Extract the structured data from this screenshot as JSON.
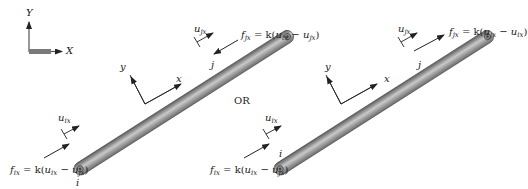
{
  "global_axes": {
    "y_label": "Y",
    "x_label": "X"
  },
  "separator": "OR",
  "diagrams": [
    {
      "node_i": "i",
      "node_j": "j",
      "local_y": "y",
      "local_x": "x",
      "disp_i": {
        "base": "u",
        "sub": "ix"
      },
      "disp_j": {
        "base": "u",
        "sub": "jx"
      },
      "force_i": "f_ix = k(u_ix − u_jx)",
      "force_j": "f_jx = k(u_ix − u_jx)",
      "force_i_parts": {
        "f": "f",
        "f_sub": "ix",
        "eq": " = k(",
        "u1": "u",
        "u1_sub": "ix",
        "minus": " − ",
        "u2": "u",
        "u2_sub": "jx",
        "close": ")"
      },
      "force_j_parts": {
        "f": "f",
        "f_sub": "jx",
        "eq": " = k(",
        "u1": "u",
        "u1_sub": "ix",
        "minus": " − ",
        "u2": "u",
        "u2_sub": "jx",
        "close": ")"
      }
    },
    {
      "node_i": "i",
      "node_j": "j",
      "local_y": "y",
      "local_x": "x",
      "disp_i": {
        "base": "u",
        "sub": "ix"
      },
      "disp_j": {
        "base": "u",
        "sub": "jx"
      },
      "force_i": "f_ix = k(u_ix − u_jx)",
      "force_j": "f_jx = k(u_jx − u_ix)",
      "force_i_parts": {
        "f": "f",
        "f_sub": "ix",
        "eq": " = k(",
        "u1": "u",
        "u1_sub": "ix",
        "minus": " − ",
        "u2": "u",
        "u2_sub": "jx",
        "close": ")"
      },
      "force_j_parts": {
        "f": "f",
        "f_sub": "jx",
        "eq": " = k(",
        "u1": "u",
        "u1_sub": "jx",
        "minus": " − ",
        "u2": "u",
        "u2_sub": "ix",
        "close": ")"
      }
    }
  ],
  "colors": {
    "bar_dark": "#6e6e6e",
    "bar_light": "#c8c8c8",
    "line": "#222222",
    "axis_bar": "#7a7a7a"
  }
}
